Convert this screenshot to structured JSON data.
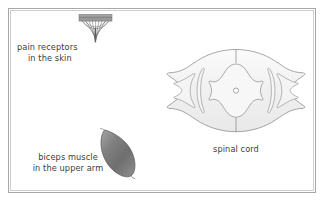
{
  "figure": {
    "background_color": "#ffffff",
    "frame_color": "#a8a8a8",
    "text_color": "#3d3d3d"
  },
  "labels": {
    "pain_receptors_line1": "pain receptors",
    "pain_receptors_line2": "in the skin",
    "biceps_line1": "biceps muscle",
    "biceps_line2": "in the upper arm",
    "spinal_cord": "spinal cord"
  },
  "structures": [
    {
      "name": "pain-receptor",
      "label": "pain receptors in the skin",
      "description": "Free nerve endings branching in a fan beneath a hatched skin layer bar",
      "fill_color": "#9a9a9a",
      "stroke_color": "#6e6e6e"
    },
    {
      "name": "biceps-muscle",
      "label": "biceps muscle in the upper arm",
      "description": "Spindle shaped muscle belly with tapered tendons at both ends",
      "fill_color": "#7c7c7c",
      "stroke_color": "#5a5a5a"
    },
    {
      "name": "spinal-cord",
      "label": "spinal cord",
      "description": "Transverse section showing butterfly shaped grey matter, central canal and lateral nerve roots",
      "fill_color": "#f2f2f2",
      "stroke_color": "#8c8c8c"
    }
  ]
}
